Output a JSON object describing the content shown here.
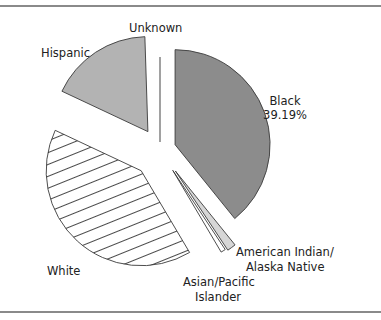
{
  "chart_data": {
    "type": "pie",
    "title": "",
    "exploded": true,
    "slices": [
      {
        "name": "Black",
        "value": 39.19,
        "label": "Black",
        "value_label": "39.19%",
        "fill": "#8c8c8c",
        "pattern": "solid"
      },
      {
        "name": "American Indian/Alaska Native",
        "value": 1.5,
        "label_lines": [
          "American Indian/",
          "Alaska Native"
        ],
        "fill": "#d6d6d6",
        "pattern": "solid"
      },
      {
        "name": "Asian/Pacific Islander",
        "value": 0.8,
        "label_lines": [
          "Asian/Pacific",
          "Islander"
        ],
        "fill": "#ffffff",
        "pattern": "solid"
      },
      {
        "name": "White",
        "value": 40.5,
        "label": "White",
        "fill": "#ffffff",
        "pattern": "horizontal-hatch"
      },
      {
        "name": "Hispanic",
        "value": 17.5,
        "label": "Hispanic",
        "fill": "#b3b3b3",
        "pattern": "solid"
      },
      {
        "name": "Unknown",
        "value": 0.51,
        "label": "Unknown",
        "fill": "#bdbdbd",
        "pattern": "solid"
      }
    ],
    "start_angle_deg": 0,
    "direction": "clockwise",
    "legend": "none (direct labels)"
  }
}
